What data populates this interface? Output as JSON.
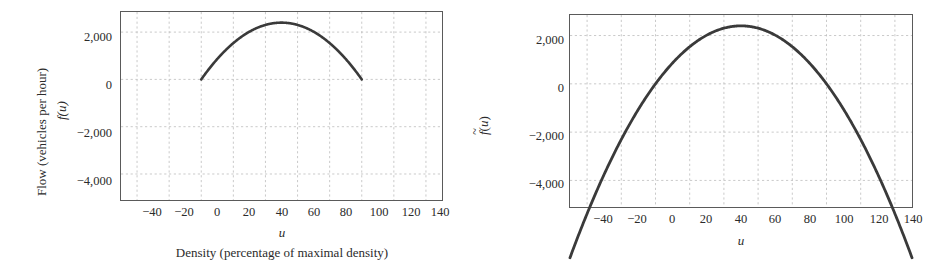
{
  "figure": {
    "background": "#ffffff",
    "curve_color": "#3a3a3a",
    "grid_color": "#bdbdbd",
    "frame_color": "#5a5a5a",
    "text_color": "#2b2b2b"
  },
  "panels": [
    {
      "id": "left",
      "y_axis_label_outer": "Flow (vehicles per hour)",
      "y_axis_label_inner": "f(u)",
      "x_axis_label_inner": "u",
      "x_axis_label_outer": "Density (percentage of maximal density)",
      "x_ticks": [
        "−40",
        "−20",
        "0",
        "20",
        "40",
        "60",
        "80",
        "100",
        "120",
        "140"
      ],
      "y_ticks": [
        "2,000",
        "0",
        "−2,000",
        "−4,000"
      ]
    },
    {
      "id": "right",
      "y_axis_label_outer": "",
      "y_axis_label_inner": "f(u)",
      "x_axis_label_inner": "u",
      "x_axis_label_outer": "",
      "x_ticks": [
        "−40",
        "−20",
        "0",
        "20",
        "40",
        "60",
        "80",
        "100",
        "120",
        "140"
      ],
      "y_ticks": [
        "2,000",
        "0",
        "−2,000",
        "−4,000"
      ]
    }
  ],
  "chart_data": [
    {
      "type": "line",
      "title": "",
      "xlabel": "Density (percentage of maximal density)",
      "ylabel": "Flow (vehicles per hour)",
      "series_name": "f(u)",
      "xlim": [
        -50,
        150
      ],
      "ylim": [
        -5100,
        2850
      ],
      "xticks": [
        -40,
        -20,
        0,
        20,
        40,
        60,
        80,
        100,
        120,
        140
      ],
      "yticks": [
        2000,
        0,
        -2000,
        -4000
      ],
      "grid": true,
      "legend": "none",
      "domain_drawn": [
        0,
        100
      ],
      "note": "Greenshields flux f(u)=0.96*u*(100-u), drawn only on the physical domain 0 to 100",
      "x": [
        0,
        5,
        10,
        15,
        20,
        25,
        30,
        35,
        40,
        45,
        50,
        55,
        60,
        65,
        70,
        75,
        80,
        85,
        90,
        95,
        100
      ],
      "y": [
        0,
        456,
        864,
        1224,
        1536,
        1800,
        2016,
        2184,
        2304,
        2376,
        2400,
        2376,
        2304,
        2184,
        2016,
        1800,
        1536,
        1224,
        864,
        456,
        0
      ]
    },
    {
      "type": "line",
      "title": "",
      "xlabel": "u",
      "ylabel": "f~(u)",
      "series_name": "f~(u)",
      "xlim": [
        -50,
        150
      ],
      "ylim": [
        -5100,
        2850
      ],
      "xticks": [
        -40,
        -20,
        0,
        20,
        40,
        60,
        80,
        100,
        120,
        140
      ],
      "yticks": [
        2000,
        0,
        -2000,
        -4000
      ],
      "grid": true,
      "legend": "none",
      "domain_drawn": [
        -50,
        150
      ],
      "note": "Extended flux f~(u)=0.96*u*(100-u) drawn across the full extended domain -50 to 150",
      "x": [
        -50,
        -40,
        -30,
        -20,
        -10,
        0,
        10,
        20,
        30,
        40,
        50,
        60,
        70,
        80,
        90,
        100,
        110,
        120,
        130,
        140,
        150
      ],
      "y": [
        -7200,
        -5376,
        -3744,
        -2304,
        -1056,
        0,
        864,
        1536,
        2016,
        2304,
        2400,
        2304,
        2016,
        1536,
        864,
        0,
        -1056,
        -2304,
        -3744,
        -5376,
        -7200
      ]
    }
  ]
}
